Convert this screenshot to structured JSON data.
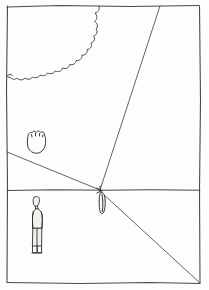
{
  "artwork": {
    "title": "One-point perspective landscape sketch",
    "medium": "pencil line drawing on paper",
    "caption": "",
    "background_color": "#fdfdfc",
    "ink_color": "#3a3a3a"
  },
  "frame": {
    "label": "drawing border rectangle",
    "left": 7,
    "top": 6,
    "right": 200,
    "bottom": 283
  },
  "scene": {
    "horizon": {
      "label": "horizon line",
      "y": 190,
      "x_start": 7,
      "x_end": 200
    },
    "vanishing_point": {
      "label": "vanishing point",
      "x": 100,
      "y": 190
    },
    "perspective_lines": [
      {
        "name": "left-receding-edge",
        "label": "left ground receding line",
        "from_x": 7,
        "from_y": 152,
        "to_x": 100,
        "to_y": 190
      },
      {
        "name": "upper-right-receding-edge",
        "label": "upper right receding line",
        "from_x": 160,
        "from_y": 6,
        "to_x": 100,
        "to_y": 190
      },
      {
        "name": "lower-right-receding-edge",
        "label": "lower right receding line",
        "from_x": 200,
        "from_y": 283,
        "to_x": 102,
        "to_y": 193
      }
    ],
    "objects": [
      {
        "name": "cloud",
        "label": "scalloped cloud",
        "region": "upper left",
        "x": 8,
        "y": 6,
        "width": 92,
        "height": 82
      },
      {
        "name": "bush",
        "label": "small bush",
        "region": "middle left",
        "x": 26,
        "y": 130,
        "width": 22,
        "height": 24
      },
      {
        "name": "standing-figure",
        "label": "standing person in foreground",
        "region": "lower left",
        "x": 28,
        "y": 196,
        "width": 18,
        "height": 58
      },
      {
        "name": "distant-figure",
        "label": "tiny distant figure at vanishing point",
        "region": "center",
        "x": 98,
        "y": 192,
        "width": 8,
        "height": 24
      }
    ]
  }
}
